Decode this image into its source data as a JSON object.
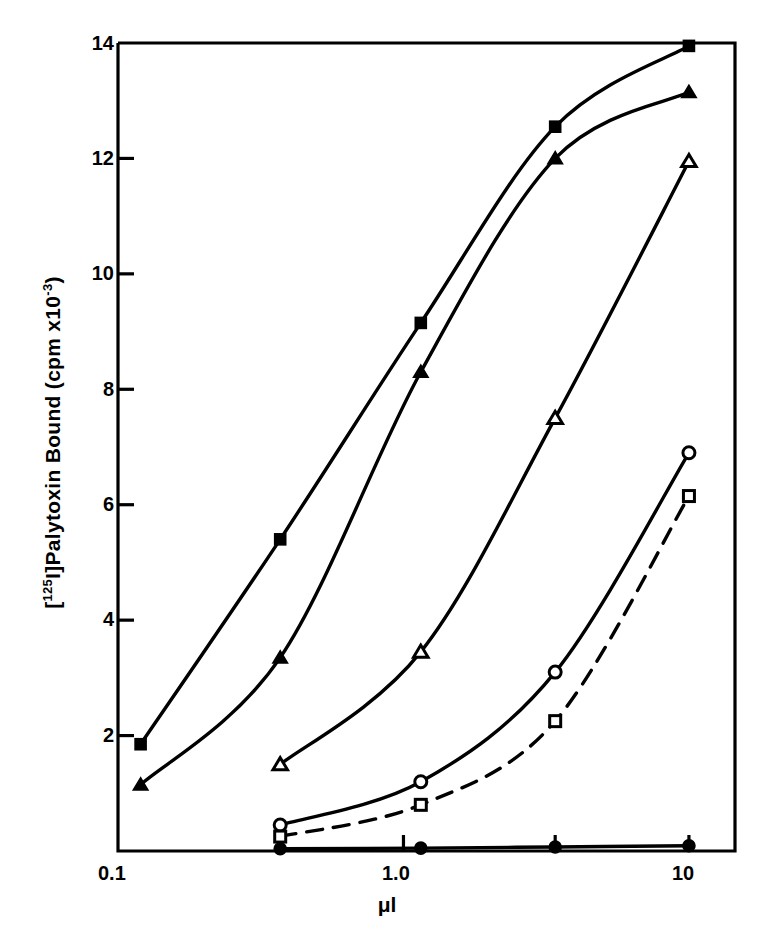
{
  "figure": {
    "background_color": "#ffffff",
    "ink_color": "#000000"
  },
  "axes": {
    "y_label_prefix": "[",
    "y_label_sup1": "125",
    "y_label_mid": "I]Palytoxin Bound (cpm x10",
    "y_label_sup2": "-3",
    "y_label_suffix": ")",
    "y_label_plain": "[125I]Palytoxin Bound (cpm x10-3)",
    "x_label": "μl",
    "y_ticks": [
      "2",
      "4",
      "6",
      "8",
      "10",
      "12",
      "14"
    ],
    "x_ticks": [
      "0.1",
      "1.0",
      "10"
    ]
  },
  "chart_data": {
    "type": "line",
    "title": "",
    "xlabel": "μl",
    "ylabel": "[125I]Palytoxin Bound (cpm x10-3)",
    "xscale": "log",
    "xlim": [
      0.1,
      14.5
    ],
    "ylim": [
      0,
      14
    ],
    "grid": false,
    "legend_position": "none",
    "series": [
      {
        "name": "filled-square",
        "marker": "filled-square",
        "line_style": "solid",
        "points": [
          {
            "x": 0.12,
            "y": 1.85
          },
          {
            "x": 0.37,
            "y": 5.4
          },
          {
            "x": 1.15,
            "y": 9.15
          },
          {
            "x": 3.4,
            "y": 12.55
          },
          {
            "x": 10.0,
            "y": 13.95
          }
        ]
      },
      {
        "name": "filled-triangle",
        "marker": "filled-triangle",
        "line_style": "solid",
        "points": [
          {
            "x": 0.12,
            "y": 1.15
          },
          {
            "x": 0.37,
            "y": 3.35
          },
          {
            "x": 1.15,
            "y": 8.3
          },
          {
            "x": 3.4,
            "y": 12.0
          },
          {
            "x": 10.0,
            "y": 13.15
          }
        ]
      },
      {
        "name": "open-triangle",
        "marker": "open-triangle",
        "line_style": "solid",
        "points": [
          {
            "x": 0.37,
            "y": 1.5
          },
          {
            "x": 1.15,
            "y": 3.45
          },
          {
            "x": 3.4,
            "y": 7.5
          },
          {
            "x": 10.0,
            "y": 11.95
          }
        ]
      },
      {
        "name": "open-circle",
        "marker": "open-circle",
        "line_style": "solid",
        "points": [
          {
            "x": 0.37,
            "y": 0.45
          },
          {
            "x": 1.15,
            "y": 1.2
          },
          {
            "x": 3.4,
            "y": 3.1
          },
          {
            "x": 10.0,
            "y": 6.9
          }
        ]
      },
      {
        "name": "open-square",
        "marker": "open-square",
        "line_style": "dashed",
        "points": [
          {
            "x": 0.37,
            "y": 0.25
          },
          {
            "x": 1.15,
            "y": 0.8
          },
          {
            "x": 3.4,
            "y": 2.25
          },
          {
            "x": 10.0,
            "y": 6.15
          }
        ]
      },
      {
        "name": "filled-circle",
        "marker": "filled-circle",
        "line_style": "solid",
        "points": [
          {
            "x": 0.37,
            "y": 0.04
          },
          {
            "x": 1.15,
            "y": 0.05
          },
          {
            "x": 3.4,
            "y": 0.07
          },
          {
            "x": 10.0,
            "y": 0.09
          }
        ]
      }
    ]
  }
}
